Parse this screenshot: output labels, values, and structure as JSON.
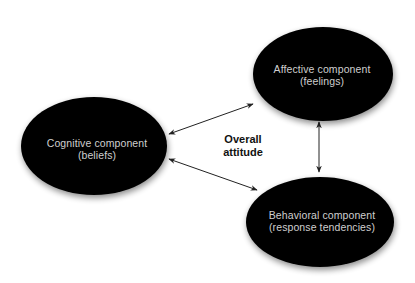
{
  "diagram": {
    "center_label": {
      "lines": [
        "Overall",
        "attitude"
      ],
      "x": 243,
      "y": [
        143,
        156
      ]
    },
    "nodes": [
      {
        "id": "cognitive",
        "lines": [
          "Cognitive component",
          "(beliefs)"
        ],
        "cx": 94,
        "cy": 146,
        "rx": 73,
        "ry": 49,
        "text_x": 97,
        "text_y": [
          147,
          159
        ]
      },
      {
        "id": "affective",
        "lines": [
          "Affective component",
          "(feelings)"
        ],
        "cx": 323,
        "cy": 74,
        "rx": 70,
        "ry": 47,
        "text_x": 322,
        "text_y": [
          73,
          85
        ]
      },
      {
        "id": "behavioral",
        "lines": [
          "Behavioral component",
          "(response tendencies)"
        ],
        "cx": 320,
        "cy": 222,
        "rx": 74,
        "ry": 45,
        "text_x": 322,
        "text_y": [
          219,
          231
        ]
      }
    ],
    "connectors": [
      {
        "id": "cognitive-affective",
        "x1": 169,
        "y1": 134,
        "x2": 253,
        "y2": 104,
        "bidirectional": true
      },
      {
        "id": "cognitive-behavioral",
        "x1": 169,
        "y1": 159,
        "x2": 257,
        "y2": 190,
        "bidirectional": true
      },
      {
        "id": "affective-behavioral",
        "x1": 319,
        "y1": 122,
        "x2": 319,
        "y2": 172,
        "bidirectional": true
      }
    ],
    "colors": {
      "node_fill": "#000000",
      "node_text": "#cfcfcf",
      "center_text": "#111111",
      "connector": "#222222",
      "background": "#ffffff"
    }
  }
}
